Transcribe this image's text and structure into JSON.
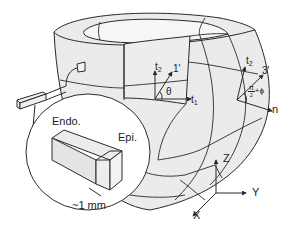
{
  "figure": {
    "colors": {
      "stroke": "#2a2a2a",
      "fill": "#e8e8e8",
      "background": "#ffffff"
    }
  },
  "inset": {
    "endo_label": "Endo.",
    "epi_label": "Epi.",
    "scale_label": "~1 mm"
  },
  "local_frame_1": {
    "t2_label": "t",
    "t2_sub": "2",
    "fiber_label": "1'",
    "angle_label": "θ",
    "t1_label": "t",
    "t1_sub": "1"
  },
  "local_frame_2": {
    "t2_label": "t",
    "t2_sub": "2",
    "sheet_label": "3'",
    "angle_num": "π",
    "angle_den": "2",
    "angle_rest": "+ϕ",
    "normal_label": "n"
  },
  "global_axes": {
    "z_label": "Z",
    "y_label": "Y",
    "x_label": "X"
  }
}
